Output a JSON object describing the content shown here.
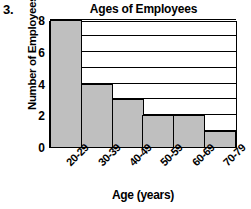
{
  "problem_number": "3.",
  "chart_data": {
    "type": "bar",
    "title": "Ages of Employees",
    "xlabel": "Age (years)",
    "ylabel": "Number of Employees",
    "categories": [
      "20-29",
      "30-39",
      "40-49",
      "50-59",
      "60-69",
      "70-79"
    ],
    "values": [
      8,
      4,
      3,
      2,
      2,
      1
    ],
    "ylim": [
      0,
      8
    ],
    "y_ticks": [
      0,
      2,
      4,
      6,
      8
    ],
    "y_tick_labels": [
      "0",
      "2",
      "4",
      "6",
      "8"
    ],
    "gridlines": [
      1,
      2,
      3,
      4,
      5,
      6,
      7,
      8
    ],
    "grid": true,
    "legend": "none",
    "bar_fill_color": "#bfbfbf",
    "bar_border_color": "#000000",
    "axis_color": "#000000",
    "background_color": "#ffffff"
  }
}
